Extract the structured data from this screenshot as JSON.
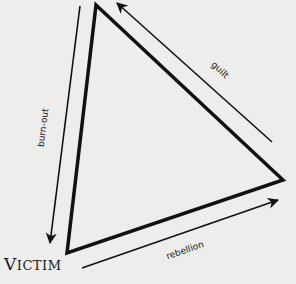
{
  "diagram": {
    "type": "drama-triangle",
    "colors": {
      "background": "#ededeb",
      "ink": "#111111"
    },
    "vertices": {
      "top": [
        96,
        5
      ],
      "right": [
        283,
        180
      ],
      "bottom_left": [
        67,
        253
      ]
    },
    "corner_label": {
      "first_letter": "V",
      "rest": "ICTIM",
      "full": "Victim"
    },
    "arrows": [
      {
        "label": "burn-out",
        "from": "top",
        "to": "bottom_left",
        "direction": "down"
      },
      {
        "label": "guilt",
        "from": "right",
        "to": "top",
        "direction": "up-left"
      },
      {
        "label": "rebellion",
        "from": "bottom_left",
        "to": "right",
        "direction": "up-right"
      }
    ]
  }
}
